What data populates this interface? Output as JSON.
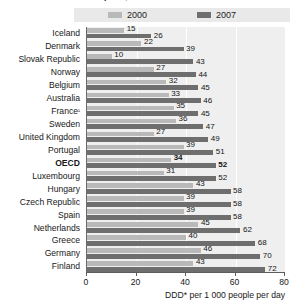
{
  "title": "Pharmaceutical consumption, 2000 and 2007",
  "legend": {
    "items": [
      {
        "label": "2000",
        "color": "#b9b9b9"
      },
      {
        "label": "2007",
        "color": "#6e6e6e"
      }
    ]
  },
  "axis": {
    "ticks": [
      "0",
      "20",
      "40",
      "60",
      "80"
    ],
    "title": "DDD* per 1 000 people per day"
  },
  "chart_data": {
    "type": "bar",
    "orientation": "horizontal",
    "title": "Pharmaceutical consumption, 2000 and 2007",
    "xlabel": "DDD* per 1 000 people per day",
    "ylabel": "",
    "xlim": [
      0,
      80
    ],
    "xticks": [
      0,
      20,
      40,
      60,
      80
    ],
    "grid": true,
    "legend_position": "top",
    "categories": [
      "Iceland",
      "Denmark",
      "Slovak Republic",
      "Norway",
      "Belgium",
      "Australia",
      "France¹",
      "Sweden",
      "United Kingdom",
      "Portugal",
      "OECD",
      "Luxembourg",
      "Hungary",
      "Czech Republic",
      "Spain",
      "Netherlands",
      "Greece",
      "Germany",
      "Finland"
    ],
    "highlight_category": "OECD",
    "series": [
      {
        "name": "2000",
        "color": "#b9b9b9",
        "values": [
          15,
          22,
          10,
          27,
          32,
          33,
          35,
          36,
          27,
          39,
          34,
          31,
          43,
          39,
          39,
          45,
          40,
          46,
          43
        ]
      },
      {
        "name": "2007",
        "color": "#6e6e6e",
        "values": [
          26,
          39,
          43,
          44,
          45,
          46,
          45,
          47,
          49,
          51,
          52,
          52,
          58,
          58,
          58,
          62,
          68,
          70,
          72
        ]
      }
    ],
    "footnote_marker": "¹",
    "axis_note": "DDD* per 1 000 people per day"
  }
}
